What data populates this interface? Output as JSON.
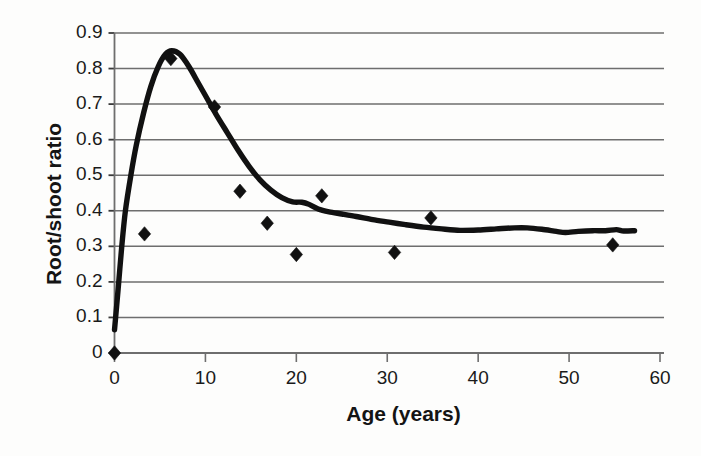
{
  "chart_data": {
    "type": "scatter",
    "title": "",
    "xlabel": "Age (years)",
    "ylabel": "Root/shoot ratio",
    "xlim": [
      0,
      60
    ],
    "ylim": [
      0,
      0.9
    ],
    "grid": "horizontal",
    "legend": "none",
    "xticks": [
      "0",
      "10",
      "20",
      "30",
      "40",
      "50",
      "60"
    ],
    "xtick_values": [
      0,
      10,
      20,
      30,
      40,
      50,
      60
    ],
    "yticks": [
      "0",
      "0.1",
      "0.2",
      "0.3",
      "0.4",
      "0.5",
      "0.6",
      "0.7",
      "0.8",
      "0.9"
    ],
    "ytick_values": [
      0,
      0.1,
      0.2,
      0.3,
      0.4,
      0.5,
      0.6,
      0.7,
      0.8,
      0.9
    ],
    "series": [
      {
        "name": "Observed data",
        "marker": "filled-diamond",
        "color": "#111111",
        "type": "scatter",
        "points": [
          [
            0.0,
            0.0
          ],
          [
            3.3,
            0.335
          ],
          [
            6.2,
            0.828
          ],
          [
            11.0,
            0.692
          ],
          [
            13.8,
            0.455
          ],
          [
            16.8,
            0.365
          ],
          [
            20.0,
            0.277
          ],
          [
            22.8,
            0.442
          ],
          [
            30.8,
            0.283
          ],
          [
            34.8,
            0.38
          ],
          [
            54.8,
            0.304
          ]
        ]
      },
      {
        "name": "Modelled curve",
        "marker": "none",
        "color": "#111111",
        "type": "line",
        "points": [
          [
            0.0,
            0.065
          ],
          [
            0.4,
            0.18
          ],
          [
            0.8,
            0.3
          ],
          [
            1.2,
            0.4
          ],
          [
            1.8,
            0.5
          ],
          [
            2.4,
            0.585
          ],
          [
            3.2,
            0.675
          ],
          [
            4.0,
            0.75
          ],
          [
            4.8,
            0.805
          ],
          [
            5.6,
            0.84
          ],
          [
            6.3,
            0.85
          ],
          [
            7.2,
            0.84
          ],
          [
            8.2,
            0.805
          ],
          [
            9.2,
            0.76
          ],
          [
            10.2,
            0.715
          ],
          [
            11.2,
            0.67
          ],
          [
            12.4,
            0.62
          ],
          [
            13.6,
            0.57
          ],
          [
            14.8,
            0.525
          ],
          [
            16.0,
            0.487
          ],
          [
            17.2,
            0.458
          ],
          [
            18.4,
            0.437
          ],
          [
            19.6,
            0.425
          ],
          [
            20.6,
            0.424
          ],
          [
            21.4,
            0.418
          ],
          [
            22.4,
            0.405
          ],
          [
            23.6,
            0.397
          ],
          [
            25.0,
            0.391
          ],
          [
            26.6,
            0.384
          ],
          [
            28.4,
            0.375
          ],
          [
            30.2,
            0.368
          ],
          [
            32.0,
            0.361
          ],
          [
            34.0,
            0.354
          ],
          [
            36.0,
            0.349
          ],
          [
            38.0,
            0.345
          ],
          [
            40.0,
            0.346
          ],
          [
            42.0,
            0.349
          ],
          [
            44.0,
            0.352
          ],
          [
            45.4,
            0.352
          ],
          [
            47.0,
            0.348
          ],
          [
            48.6,
            0.342
          ],
          [
            49.6,
            0.339
          ],
          [
            51.0,
            0.342
          ],
          [
            52.6,
            0.344
          ],
          [
            54.0,
            0.344
          ],
          [
            55.2,
            0.347
          ],
          [
            56.0,
            0.343
          ],
          [
            57.2,
            0.344
          ]
        ]
      }
    ]
  },
  "axes": {
    "y_axis_name": "root-shoot-ratio-axis",
    "x_axis_name": "age-axis"
  }
}
